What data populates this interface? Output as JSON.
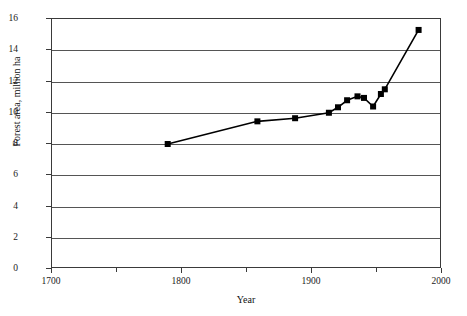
{
  "chart_data": {
    "type": "line",
    "title": "",
    "xlabel": "Year",
    "ylabel": "Forest area, million ha",
    "xlim": [
      1700,
      2000
    ],
    "ylim": [
      0,
      16
    ],
    "xticks": [
      1700,
      1800,
      1900,
      2000
    ],
    "xticks_minor": [
      1750,
      1850,
      1950
    ],
    "yticks": [
      0,
      2,
      4,
      6,
      8,
      10,
      12,
      14,
      16
    ],
    "grid": "horizontal",
    "legend": "none",
    "marker": "square",
    "marker_color": "#000000",
    "line_color": "#000000",
    "series": [
      {
        "name": "Forest area",
        "points": [
          {
            "x": 1789,
            "y": 8.0
          },
          {
            "x": 1858,
            "y": 9.45
          },
          {
            "x": 1887,
            "y": 9.65
          },
          {
            "x": 1913,
            "y": 10.0
          },
          {
            "x": 1920,
            "y": 10.35
          },
          {
            "x": 1927,
            "y": 10.8
          },
          {
            "x": 1935,
            "y": 11.05
          },
          {
            "x": 1940,
            "y": 10.95
          },
          {
            "x": 1947,
            "y": 10.4
          },
          {
            "x": 1953,
            "y": 11.2
          },
          {
            "x": 1956,
            "y": 11.5
          },
          {
            "x": 1982,
            "y": 15.3
          }
        ]
      }
    ]
  }
}
